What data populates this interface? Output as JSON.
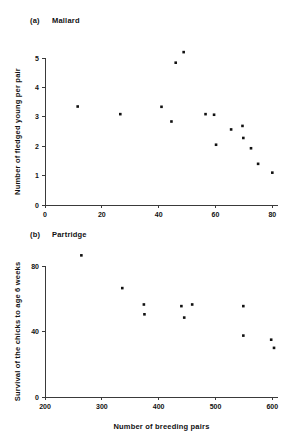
{
  "figure": {
    "background": "#ffffff",
    "marker_color": "#111111",
    "axis_color": "#3a3a3a"
  },
  "panels": [
    {
      "tag": "(a)",
      "title": "Mallard"
    },
    {
      "tag": "(b)",
      "title": "Partridge"
    }
  ],
  "chart_data": [
    {
      "type": "scatter",
      "title": "(a)   Mallard",
      "panel_tag": "(a)",
      "panel_title": "Mallard",
      "xlabel": "",
      "ylabel": "Number of fledged young per pair",
      "xlim": [
        0,
        82
      ],
      "ylim": [
        0,
        5.3
      ],
      "xticks": [
        0,
        20,
        40,
        60,
        80
      ],
      "yticks": [
        0,
        1,
        2,
        3,
        4,
        5
      ],
      "xticklabels": [
        "0",
        "20",
        "40",
        "60",
        "80"
      ],
      "yticklabels": [
        "0",
        "1",
        "2",
        "3",
        "4",
        "5"
      ],
      "grid": false,
      "legend": false,
      "marker": "filled-square",
      "points": [
        {
          "x": 11.5,
          "y": 3.35
        },
        {
          "x": 26.5,
          "y": 3.09
        },
        {
          "x": 41.0,
          "y": 3.34
        },
        {
          "x": 44.5,
          "y": 2.84
        },
        {
          "x": 46.0,
          "y": 4.84
        },
        {
          "x": 48.8,
          "y": 5.2
        },
        {
          "x": 56.5,
          "y": 3.09
        },
        {
          "x": 59.5,
          "y": 3.07
        },
        {
          "x": 60.2,
          "y": 2.05
        },
        {
          "x": 65.5,
          "y": 2.57
        },
        {
          "x": 69.5,
          "y": 2.69
        },
        {
          "x": 69.8,
          "y": 2.28
        },
        {
          "x": 72.5,
          "y": 1.93
        },
        {
          "x": 75.0,
          "y": 1.4
        },
        {
          "x": 80.0,
          "y": 1.1
        }
      ]
    },
    {
      "type": "scatter",
      "title": "(b)   Partridge",
      "panel_tag": "(b)",
      "panel_title": "Partridge",
      "xlabel": "Number of breeding pairs",
      "ylabel": "Survival of the chicks to age 6 weeks",
      "xlim": [
        200,
        610
      ],
      "ylim": [
        0,
        88
      ],
      "xticks": [
        200,
        300,
        400,
        500,
        600
      ],
      "yticks": [
        0,
        40,
        80
      ],
      "xticklabels": [
        "200",
        "300",
        "400",
        "500",
        "600"
      ],
      "yticklabels": [
        "0",
        "40",
        "80"
      ],
      "grid": false,
      "legend": false,
      "marker": "filled-square",
      "points": [
        {
          "x": 264,
          "y": 86.5
        },
        {
          "x": 336,
          "y": 66.5
        },
        {
          "x": 374,
          "y": 56.5
        },
        {
          "x": 375,
          "y": 50.5
        },
        {
          "x": 440,
          "y": 55.5
        },
        {
          "x": 445,
          "y": 48.5
        },
        {
          "x": 459,
          "y": 56.5
        },
        {
          "x": 549,
          "y": 55.5
        },
        {
          "x": 549,
          "y": 37.5
        },
        {
          "x": 598,
          "y": 35.0
        },
        {
          "x": 603,
          "y": 30.0
        }
      ]
    }
  ]
}
